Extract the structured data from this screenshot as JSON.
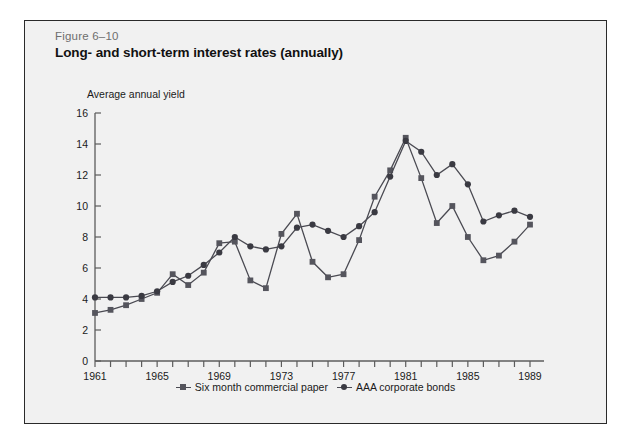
{
  "figure": {
    "number": "Figure 6–10",
    "title": "Long- and short-term interest rates (annually)"
  },
  "chart_data": {
    "type": "line",
    "title": "Long- and short-term interest rates (annually)",
    "subtitle": "Figure 6–10",
    "xlabel": "",
    "ylabel": "Average annual yield",
    "xlim": [
      1961,
      1989
    ],
    "ylim": [
      0,
      16
    ],
    "ytick_step": 2,
    "yticks": [
      0,
      2,
      4,
      6,
      8,
      10,
      12,
      14,
      16
    ],
    "xticks_labeled": [
      1961,
      1965,
      1969,
      1973,
      1977,
      1981,
      1985,
      1989
    ],
    "xtick_interval_minor": 1,
    "grid": false,
    "legend_position": "bottom-center",
    "x": [
      1961,
      1962,
      1963,
      1964,
      1965,
      1966,
      1967,
      1968,
      1969,
      1970,
      1971,
      1972,
      1973,
      1974,
      1975,
      1976,
      1977,
      1978,
      1979,
      1980,
      1981,
      1982,
      1983,
      1984,
      1985,
      1986,
      1987,
      1988,
      1989
    ],
    "series": [
      {
        "name": "Six month commercial paper",
        "marker": "square",
        "color": "#55555d",
        "values": [
          3.1,
          3.3,
          3.6,
          4.0,
          4.4,
          5.6,
          4.9,
          5.7,
          7.6,
          7.7,
          5.2,
          4.7,
          8.2,
          9.5,
          6.4,
          5.4,
          5.6,
          7.8,
          10.6,
          12.3,
          14.4,
          11.8,
          8.9,
          10.0,
          8.0,
          6.5,
          6.8,
          7.7,
          8.8
        ]
      },
      {
        "name": "AAA corporate bonds",
        "marker": "circle",
        "color": "#3a3a42",
        "values": [
          4.1,
          4.1,
          4.1,
          4.2,
          4.5,
          5.1,
          5.5,
          6.2,
          7.0,
          8.0,
          7.4,
          7.2,
          7.4,
          8.6,
          8.8,
          8.4,
          8.0,
          8.7,
          9.6,
          11.9,
          14.2,
          13.5,
          12.0,
          12.7,
          11.4,
          9.0,
          9.4,
          9.7,
          9.3
        ]
      }
    ]
  },
  "legend": {
    "items": [
      {
        "label": "Six month commercial paper"
      },
      {
        "label": "AAA corporate bonds"
      }
    ]
  }
}
